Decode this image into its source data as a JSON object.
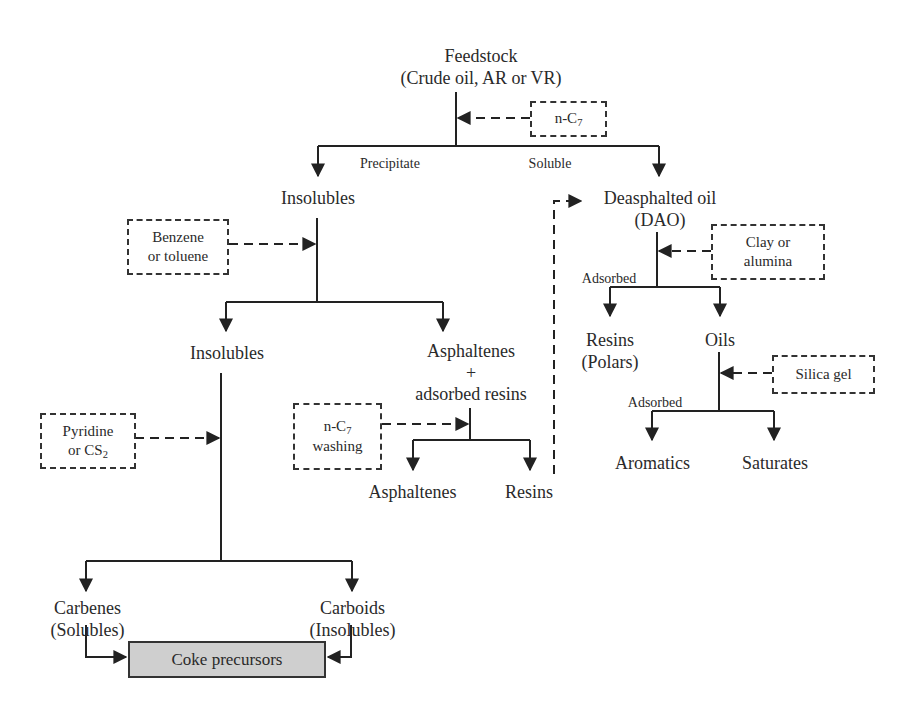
{
  "diagram": {
    "type": "flowchart",
    "nodes": {
      "feedstock": {
        "line1": "Feedstock",
        "line2": "(Crude oil, AR or VR)"
      },
      "insolubles_1": {
        "label": "Insolubles"
      },
      "dao": {
        "line1": "Deasphalted oil",
        "line2": "(DAO)"
      },
      "insolubles_2": {
        "label": "Insolubles"
      },
      "asphaltenes_resins": {
        "line1": "Asphaltenes",
        "line2": "+",
        "line3": "adsorbed resins"
      },
      "resins_polars": {
        "line1": "Resins",
        "line2": "(Polars)"
      },
      "oils": {
        "label": "Oils"
      },
      "asphaltenes": {
        "label": "Asphaltenes"
      },
      "resins": {
        "label": "Resins"
      },
      "aromatics": {
        "label": "Aromatics"
      },
      "saturates": {
        "label": "Saturates"
      },
      "carbenes": {
        "line1": "Carbenes",
        "line2": "(Solubles)"
      },
      "carboids": {
        "line1": "Carboids",
        "line2": "(Insolubles)"
      },
      "coke_precursors": {
        "label": "Coke precursors"
      }
    },
    "solvents": {
      "n_c7": {
        "prefix": "n-C",
        "sub": "7"
      },
      "benzene": {
        "line1": "Benzene",
        "line2": "or toluene"
      },
      "clay": {
        "line1": "Clay or",
        "line2": "alumina"
      },
      "silica": {
        "label": "Silica gel"
      },
      "pyridine": {
        "line1": "Pyridine",
        "line2": "or CS",
        "sub": "2"
      },
      "n_c7_washing": {
        "prefix": "n-C",
        "sub": "7",
        "line2": "washing"
      }
    },
    "edge_labels": {
      "precipitate": "Precipitate",
      "soluble": "Soluble",
      "adsorbed_dao": "Adsorbed",
      "adsorbed_oils": "Adsorbed"
    },
    "colors": {
      "line": "#222222",
      "coke_fill": "#cfcfcf"
    }
  }
}
